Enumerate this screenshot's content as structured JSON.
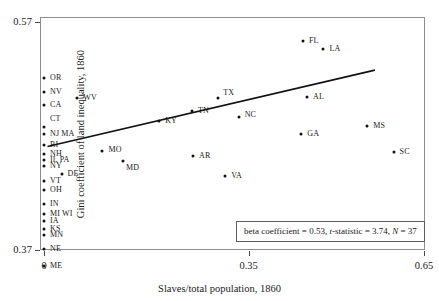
{
  "chart_data": {
    "type": "scatter",
    "title": "",
    "xlabel": "Slaves/total population, 1860",
    "ylabel": "Gini coefficient of land inequality, 1860",
    "xlim": [
      0,
      0.65
    ],
    "ylim": [
      0.37,
      0.57
    ],
    "xticks": [
      "0",
      "0.35",
      "0.65"
    ],
    "xtick_values": [
      0,
      0.35,
      0.65
    ],
    "yticks": [
      "0.37",
      "0.57"
    ],
    "ytick_values": [
      0.37,
      0.57
    ],
    "grid": false,
    "legend": "none",
    "annotation": {
      "beta_label": "beta coefficient = 0.53, ",
      "t_stat_italic": "t",
      "t_stat_label": "-statistic = 3.74, ",
      "n_italic": "N",
      "n_label": " = 37"
    },
    "regression_line": {
      "x_start": 0.006,
      "y_start": 0.4608,
      "x_end": 0.566,
      "y_end": 0.5278
    },
    "points": [
      {
        "label": "OR",
        "x": 0.0,
        "y": 0.521,
        "lx": 6,
        "ly": -4
      },
      {
        "label": "NV",
        "x": 0.0,
        "y": 0.509,
        "lx": 6,
        "ly": -4
      },
      {
        "label": "CA",
        "x": 0.0,
        "y": 0.4975,
        "lx": 6,
        "ly": -4
      },
      {
        "label": "WV",
        "x": 0.057,
        "y": 0.503,
        "lx": 6,
        "ly": -4
      },
      {
        "label": "CT",
        "x": 0.0,
        "y": 0.4775,
        "lx": 6,
        "ly": -12
      },
      {
        "label": "NJ MA",
        "x": 0.0,
        "y": 0.472,
        "lx": 6,
        "ly": -4
      },
      {
        "label": "RI",
        "x": 0.0,
        "y": 0.462,
        "lx": 6,
        "ly": -4
      },
      {
        "label": "NH",
        "x": 0.0,
        "y": 0.4545,
        "lx": 6,
        "ly": -4
      },
      {
        "label": "IL PA",
        "x": 0.0,
        "y": 0.449,
        "lx": 6,
        "ly": -4
      },
      {
        "label": "NY",
        "x": 0.0,
        "y": 0.444,
        "lx": 6,
        "ly": -4
      },
      {
        "label": "DE",
        "x": 0.03,
        "y": 0.437,
        "lx": 6,
        "ly": -4
      },
      {
        "label": "VT",
        "x": 0.0,
        "y": 0.4305,
        "lx": 6,
        "ly": -4
      },
      {
        "label": "OH",
        "x": 0.0,
        "y": 0.423,
        "lx": 6,
        "ly": -4
      },
      {
        "label": "IN",
        "x": 0.0,
        "y": 0.4105,
        "lx": 6,
        "ly": -4
      },
      {
        "label": "MI WI",
        "x": 0.0,
        "y": 0.402,
        "lx": 6,
        "ly": -4
      },
      {
        "label": "IA",
        "x": 0.0,
        "y": 0.3955,
        "lx": 6,
        "ly": -4
      },
      {
        "label": "KS",
        "x": 0.0,
        "y": 0.3885,
        "lx": 6,
        "ly": -4
      },
      {
        "label": "MN",
        "x": 0.0,
        "y": 0.383,
        "lx": 6,
        "ly": -4
      },
      {
        "label": "NE",
        "x": 0.0,
        "y": 0.3705,
        "lx": 6,
        "ly": -4
      },
      {
        "label": "ME",
        "x": 0.0,
        "y": 0.356,
        "lx": 6,
        "ly": -4
      },
      {
        "label": "MO",
        "x": 0.1,
        "y": 0.4565,
        "lx": 6,
        "ly": -5
      },
      {
        "label": "MD",
        "x": 0.135,
        "y": 0.4478,
        "lx": 3,
        "ly": 3
      },
      {
        "label": "KY",
        "x": 0.197,
        "y": 0.483,
        "lx": 6,
        "ly": -4
      },
      {
        "label": "TN",
        "x": 0.253,
        "y": 0.492,
        "lx": 6,
        "ly": -4
      },
      {
        "label": "TX",
        "x": 0.298,
        "y": 0.503,
        "lx": 5,
        "ly": -9
      },
      {
        "label": "NC",
        "x": 0.333,
        "y": 0.4865,
        "lx": 6,
        "ly": -6
      },
      {
        "label": "AR",
        "x": 0.255,
        "y": 0.4525,
        "lx": 6,
        "ly": -4
      },
      {
        "label": "VA",
        "x": 0.31,
        "y": 0.4345,
        "lx": 6,
        "ly": -4
      },
      {
        "label": "AL",
        "x": 0.45,
        "y": 0.504,
        "lx": 6,
        "ly": -4
      },
      {
        "label": "GA",
        "x": 0.44,
        "y": 0.472,
        "lx": 6,
        "ly": -4
      },
      {
        "label": "FL",
        "x": 0.443,
        "y": 0.553,
        "lx": 6,
        "ly": -4
      },
      {
        "label": "LA",
        "x": 0.478,
        "y": 0.5465,
        "lx": 6,
        "ly": -4
      },
      {
        "label": "MS",
        "x": 0.553,
        "y": 0.479,
        "lx": 6,
        "ly": -4
      },
      {
        "label": "SC",
        "x": 0.598,
        "y": 0.456,
        "lx": 6,
        "ly": -4
      }
    ]
  }
}
